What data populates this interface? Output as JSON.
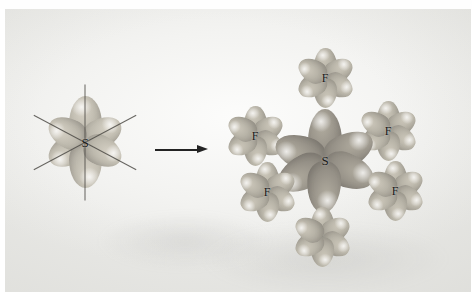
{
  "figure": {
    "kind": "orbital-diagram",
    "topic": "Octahedral sp3d2 hybrid orbitals of sulfur combining with fluorine orbitals to form SF6",
    "background_color": "#f2f2f0",
    "orbital_color_light": "#b5b1a5",
    "orbital_color_dark": "#99948a",
    "label_color": "#1a1a1a",
    "arrow_color": "#232323",
    "top_caption_ghost": "· · ·"
  },
  "left_structure": {
    "name": "free-sulfur-hybrid-orbitals",
    "center_label": "S",
    "lobe_count": 6,
    "axis_count": 3,
    "lobes": [
      {
        "id": "lobe-up",
        "angle": 0
      },
      {
        "id": "lobe-down",
        "angle": 180
      },
      {
        "id": "lobe-upper-right",
        "angle": 62
      },
      {
        "id": "lobe-lower-right",
        "angle": 118
      },
      {
        "id": "lobe-upper-left",
        "angle": 298
      },
      {
        "id": "lobe-lower-left",
        "angle": 242
      }
    ]
  },
  "arrow": {
    "name": "transformation-arrow",
    "direction": "right",
    "glyph": "→"
  },
  "right_structure": {
    "name": "sf6-molecule",
    "center_label": "S",
    "ligand_label": "F",
    "ligand_count": 6,
    "ligands": [
      {
        "id": "fluorine-top",
        "label": "F",
        "x": 320,
        "y": 69,
        "hidden": false
      },
      {
        "id": "fluorine-upper-left",
        "label": "F",
        "x": 250,
        "y": 127,
        "hidden": false
      },
      {
        "id": "fluorine-upper-right",
        "label": "F",
        "x": 383,
        "y": 122,
        "hidden": false
      },
      {
        "id": "fluorine-lower-left",
        "label": "F",
        "x": 262,
        "y": 183,
        "hidden": false
      },
      {
        "id": "fluorine-lower-right",
        "label": "F",
        "x": 390,
        "y": 182,
        "hidden": false
      },
      {
        "id": "fluorine-bottom",
        "label": "F",
        "x": 317,
        "y": 228,
        "hidden": false
      }
    ],
    "center": {
      "x": 320,
      "y": 152
    }
  }
}
